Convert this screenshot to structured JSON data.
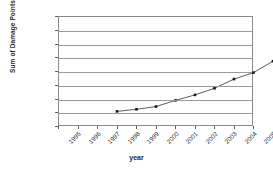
{
  "chart_data": {
    "type": "line",
    "title": "",
    "subtitle": "",
    "xlabel": "year",
    "ylabel": "Sum of Damage Points",
    "categories": [
      "1995",
      "1996",
      "1997",
      "1998",
      "1999",
      "2000",
      "2001",
      "2002",
      "2003",
      "2004",
      "2005"
    ],
    "values": [
      230000,
      245000,
      265000,
      310000,
      350000,
      398000,
      465000,
      512000,
      595000,
      658000,
      710000
    ],
    "series": [
      {
        "name": "Sum of Damage Points",
        "values": [
          230000,
          245000,
          265000,
          310000,
          350000,
          398000,
          465000,
          512000,
          595000,
          658000,
          710000
        ]
      }
    ],
    "ylim": [
      0,
      800000
    ],
    "ytick_labels": [
      "0",
      "100000",
      "200000",
      "300000",
      "400000",
      "500000",
      "600000",
      "700000",
      "800000"
    ],
    "ytick_values": [
      0,
      100000,
      200000,
      300000,
      400000,
      500000,
      600000,
      700000,
      800000
    ],
    "xtick_labels": [
      "1995",
      "1996",
      "1997",
      "1998",
      "1999",
      "2000",
      "2001",
      "2002",
      "2003",
      "2004",
      "2005"
    ],
    "grid": "horizontal",
    "legend": "none",
    "marker": "square",
    "line_color": "#4a4a4a",
    "marker_color": "#1a1a1a",
    "grid_color": "#9a9a9a",
    "axis_color": "#8a8a8a",
    "background": "#ffffff",
    "xtick_label_rotation": -45
  }
}
